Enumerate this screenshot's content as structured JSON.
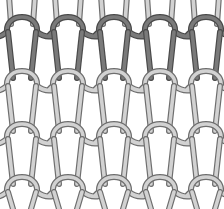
{
  "diagram": {
    "type": "knit-structure",
    "width": 224,
    "height": 209,
    "colors": {
      "background": "#ffffff",
      "yarn_dark": "#7a7a7a",
      "yarn_dark_edge": "#4a4a4a",
      "yarn_light": "#d2d2d2",
      "yarn_light_edge": "#6e6e6e"
    },
    "courses": [
      {
        "y": 30,
        "shade": "dark"
      },
      {
        "y": 84,
        "shade": "light"
      },
      {
        "y": 137,
        "shade": "light"
      },
      {
        "y": 190,
        "shade": "light"
      }
    ],
    "wales_x": [
      22,
      68,
      114,
      160,
      206
    ],
    "loop_width": 30,
    "yarn_width": 6
  }
}
